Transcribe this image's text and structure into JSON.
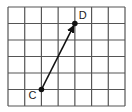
{
  "diagram": {
    "type": "grid-vector",
    "grid": {
      "columns": 7,
      "rows": 6,
      "line_color": "#555555",
      "background": "#ffffff"
    },
    "points": [
      {
        "label": "C",
        "col": 2,
        "row_from_bottom": 1
      },
      {
        "label": "D",
        "col": 4,
        "row_from_bottom": 5
      }
    ],
    "vector": {
      "from": "C",
      "to": "D",
      "arrowhead": "end",
      "color": "#111111"
    },
    "labels": {
      "start": "C",
      "end": "D"
    }
  }
}
